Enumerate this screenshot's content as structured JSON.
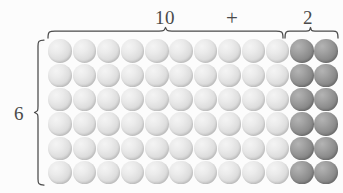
{
  "diagram": {
    "top_labels": {
      "group_a": "10",
      "operator": "+",
      "group_b": "2"
    },
    "left_label": "6",
    "grid": {
      "rows": 6,
      "columns": 12,
      "light_columns": 10,
      "dark_columns": 2,
      "total_counters": 72,
      "light_color": "#dedede",
      "dark_color": "#8e8e8e",
      "counter_name": "sphere-counter"
    },
    "braces": {
      "top_left_brace_label": "10",
      "top_right_brace_label": "2",
      "left_brace_label": "6",
      "stroke_color": "#4a4a4a"
    },
    "background_color": "#fcfcfc"
  }
}
